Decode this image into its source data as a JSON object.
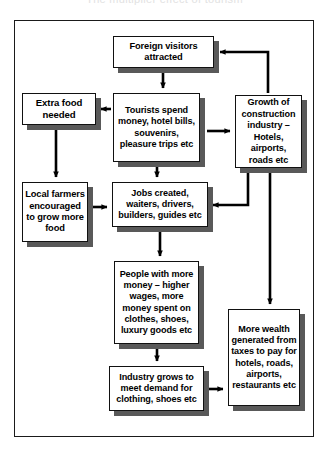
{
  "diagram": {
    "title_remnant": "The multiplier effect of tourism",
    "type": "flowchart",
    "nodes": [
      {
        "id": "foreign",
        "label": "Foreign visitors attracted"
      },
      {
        "id": "extra",
        "label": "Extra food needed"
      },
      {
        "id": "tourists",
        "label": "Tourists spend money, hotel bills, souvenirs, pleasure trips etc"
      },
      {
        "id": "growth",
        "label": "Growth of construction industry – Hotels, airports, roads etc"
      },
      {
        "id": "local",
        "label": "Local farmers encouraged to grow more food"
      },
      {
        "id": "jobs",
        "label": "Jobs created, waiters, drivers, builders, guides etc"
      },
      {
        "id": "people",
        "label": "People with more money – higher wages, more money spent on clothes, shoes, luxury goods etc"
      },
      {
        "id": "wealth",
        "label": "More wealth generated from taxes to pay for hotels, roads, airports, restaurants etc"
      },
      {
        "id": "industry",
        "label": "Industry grows to meet demand for clothing, shoes etc"
      }
    ],
    "edges": [
      {
        "from": "foreign",
        "to": "tourists"
      },
      {
        "from": "tourists",
        "to": "extra"
      },
      {
        "from": "extra",
        "to": "local"
      },
      {
        "from": "local",
        "to": "jobs"
      },
      {
        "from": "tourists",
        "to": "jobs"
      },
      {
        "from": "tourists",
        "to": "growth"
      },
      {
        "from": "growth",
        "to": "foreign"
      },
      {
        "from": "growth",
        "to": "jobs"
      },
      {
        "from": "growth",
        "to": "wealth"
      },
      {
        "from": "jobs",
        "to": "people"
      },
      {
        "from": "people",
        "to": "industry"
      },
      {
        "from": "industry",
        "to": "wealth"
      }
    ],
    "colors": {
      "box_border": "#111111",
      "box_fill": "#ffffff",
      "box_shadow": "#595959",
      "arrow": "#000000",
      "frame": "#1a1a1a"
    }
  }
}
